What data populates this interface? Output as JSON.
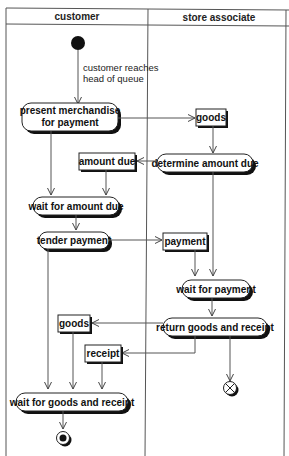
{
  "diagram": {
    "type": "UML activity diagram",
    "swimlanes": [
      {
        "id": "customer",
        "label": "customer"
      },
      {
        "id": "store",
        "label": "store associate"
      }
    ],
    "initial_node": {
      "lane": "customer"
    },
    "initial_guard": "customer reaches",
    "initial_guard_2": "head of queue",
    "actions": {
      "present": {
        "line1": "present merchandise",
        "line2": "for payment",
        "lane": "customer"
      },
      "determine": {
        "label": "determine amount due",
        "lane": "store associate"
      },
      "wait_amount": {
        "label": "wait for amount due",
        "lane": "customer"
      },
      "tender": {
        "label": "tender payment",
        "lane": "customer"
      },
      "wait_payment": {
        "label": "wait for payment",
        "lane": "store associate"
      },
      "return": {
        "label": "return goods and receipt",
        "lane": "store associate"
      },
      "wait_goods": {
        "label": "wait for goods and receipt",
        "lane": "customer"
      }
    },
    "objects": {
      "goods_1": {
        "label": "goods",
        "lane": "store associate"
      },
      "amount_due": {
        "label": "amount due",
        "lane": "customer"
      },
      "payment": {
        "label": "payment",
        "lane": "store associate"
      },
      "goods_2": {
        "label": "goods",
        "lane": "customer"
      },
      "receipt": {
        "label": "receipt",
        "lane": "customer"
      }
    },
    "final_nodes": [
      {
        "kind": "activity-final",
        "lane": "customer"
      },
      {
        "kind": "flow-final",
        "lane": "store associate"
      }
    ],
    "flows": [
      [
        "initial",
        "present merchandise for payment"
      ],
      [
        "present merchandise for payment",
        "goods"
      ],
      [
        "present merchandise for payment",
        "wait for amount due"
      ],
      [
        "goods",
        "determine amount due"
      ],
      [
        "determine amount due",
        "amount due"
      ],
      [
        "amount due",
        "wait for amount due"
      ],
      [
        "determine amount due",
        "wait for payment"
      ],
      [
        "wait for amount due",
        "tender payment"
      ],
      [
        "tender payment",
        "payment"
      ],
      [
        "payment",
        "wait for payment"
      ],
      [
        "tender payment",
        "wait for goods and receipt"
      ],
      [
        "wait for payment",
        "return goods and receipt"
      ],
      [
        "return goods and receipt",
        "goods"
      ],
      [
        "return goods and receipt",
        "receipt"
      ],
      [
        "return goods and receipt",
        "flow final"
      ],
      [
        "goods",
        "wait for goods and receipt"
      ],
      [
        "receipt",
        "wait for goods and receipt"
      ],
      [
        "wait for goods and receipt",
        "activity final"
      ]
    ]
  }
}
